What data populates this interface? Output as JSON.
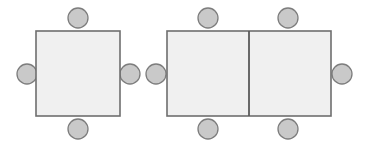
{
  "canvas": {
    "width": 367,
    "height": 148,
    "background": "#ffffff",
    "title": "Table seating arrangement diagram"
  },
  "style": {
    "table_fill": "#f0f0f0",
    "table_stroke": "#6e6e6e",
    "table_stroke_width": 1.6,
    "divider_stroke": "#5a5a5a",
    "divider_stroke_width": 1.8,
    "seat_fill": "#c9c9c9",
    "seat_stroke": "#7d7d7d",
    "seat_stroke_width": 1.3,
    "seat_radius": 10
  },
  "groups": [
    {
      "id": "square-table-group",
      "label": "Square table with four seats",
      "table": {
        "name": "square-table",
        "shape": "rect",
        "x": 36,
        "y": 31,
        "width": 84,
        "height": 85
      },
      "dividers": [],
      "seats": [
        {
          "name": "seat-top",
          "position": "top",
          "cx": 78,
          "cy": 18
        },
        {
          "name": "seat-left",
          "position": "left",
          "cx": 27,
          "cy": 74
        },
        {
          "name": "seat-right",
          "position": "right",
          "cx": 130,
          "cy": 74
        },
        {
          "name": "seat-bottom",
          "position": "bottom",
          "cx": 78,
          "cy": 129
        }
      ]
    },
    {
      "id": "rectangular-table-group",
      "label": "Rectangular double table with six seats",
      "table": {
        "name": "rectangular-table",
        "shape": "rect",
        "x": 167,
        "y": 31,
        "width": 164,
        "height": 85
      },
      "dividers": [
        {
          "name": "table-divider",
          "x1": 249,
          "y1": 31,
          "x2": 249,
          "y2": 116
        }
      ],
      "seats": [
        {
          "name": "seat-top-left",
          "position": "top",
          "cx": 208,
          "cy": 18
        },
        {
          "name": "seat-top-right",
          "position": "top",
          "cx": 288,
          "cy": 18
        },
        {
          "name": "seat-left",
          "position": "left",
          "cx": 156,
          "cy": 74
        },
        {
          "name": "seat-right",
          "position": "right",
          "cx": 342,
          "cy": 74
        },
        {
          "name": "seat-bottom-left",
          "position": "bottom",
          "cx": 208,
          "cy": 129
        },
        {
          "name": "seat-bottom-right",
          "position": "bottom",
          "cx": 288,
          "cy": 129
        }
      ]
    }
  ]
}
